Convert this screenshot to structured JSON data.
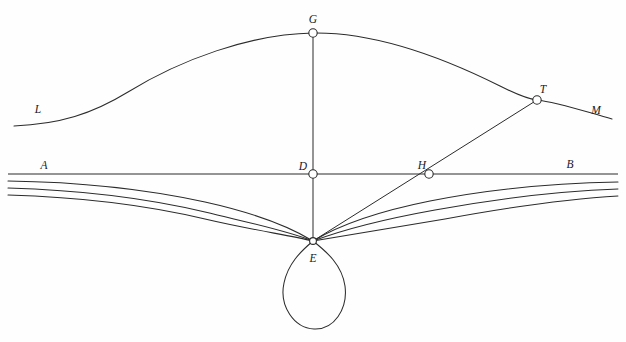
{
  "figure": {
    "background_color": "#fefefe",
    "stroke_color": "#2b2b2b",
    "width": 626,
    "height": 342
  },
  "labels": [
    {
      "id": "L",
      "text": "L",
      "x": 38,
      "y": 113
    },
    {
      "id": "G",
      "text": "G",
      "x": 313,
      "y": 23
    },
    {
      "id": "T",
      "text": "T",
      "x": 543,
      "y": 93
    },
    {
      "id": "M",
      "text": "M",
      "x": 596,
      "y": 114
    },
    {
      "id": "A",
      "text": "A",
      "x": 44,
      "y": 169
    },
    {
      "id": "D",
      "text": "D",
      "x": 303,
      "y": 170
    },
    {
      "id": "H",
      "text": "H",
      "x": 422,
      "y": 169
    },
    {
      "id": "B",
      "text": "B",
      "x": 570,
      "y": 168
    },
    {
      "id": "E",
      "text": "E",
      "x": 313,
      "y": 262
    }
  ],
  "points": [
    {
      "id": "G",
      "x": 313,
      "y": 33,
      "marker": "open-circle",
      "radius": 4.2
    },
    {
      "id": "T",
      "x": 537,
      "y": 100,
      "marker": "open-circle",
      "radius": 4.2
    },
    {
      "id": "D",
      "x": 313,
      "y": 174,
      "marker": "open-circle",
      "radius": 4.2
    },
    {
      "id": "H",
      "x": 429,
      "y": 174,
      "marker": "open-circle",
      "radius": 4.2
    },
    {
      "id": "E",
      "x": 313,
      "y": 241,
      "marker": "open-circle",
      "radius": 3.4
    }
  ],
  "paths": {
    "upper_arc_LGM": "M 14,126 C 60,124 92,114 128,92 C 180,60 250,34 313,33 C 380,32 452,62 500,86 C 516,94 527,99 537,100 C 556,102 580,110 612,119",
    "baseline_AB": "M 8,174 L 618,174",
    "segment_GD": "M 313,33 L 313,174",
    "segment_DE": "M 313,174 L 313,241",
    "ray_E_H_T": "M 313,241 L 537,100",
    "arc_2": "M 8,181 C 80,182 150,190 205,202 C 250,212 285,224 313,241 C 341,224 380,211 430,201 C 490,189 560,183 618,182",
    "arc_3": "M 8,188 C 80,190 150,199 205,212 C 250,223 285,230 313,241 C 345,229 385,219 435,210 C 495,199 562,191 618,189",
    "arc_4": "M 8,195 C 80,197 150,206 205,219 C 252,230 288,235 313,241 C 350,235 392,228 445,219 C 505,208 565,199 618,196",
    "teardrop_loop": "M 313,241 C 300,252 288,264 284,283 C 279,306 294,328 314,329 C 334,330 348,309 345,286 C 342,265 327,252 313,241 Z"
  }
}
